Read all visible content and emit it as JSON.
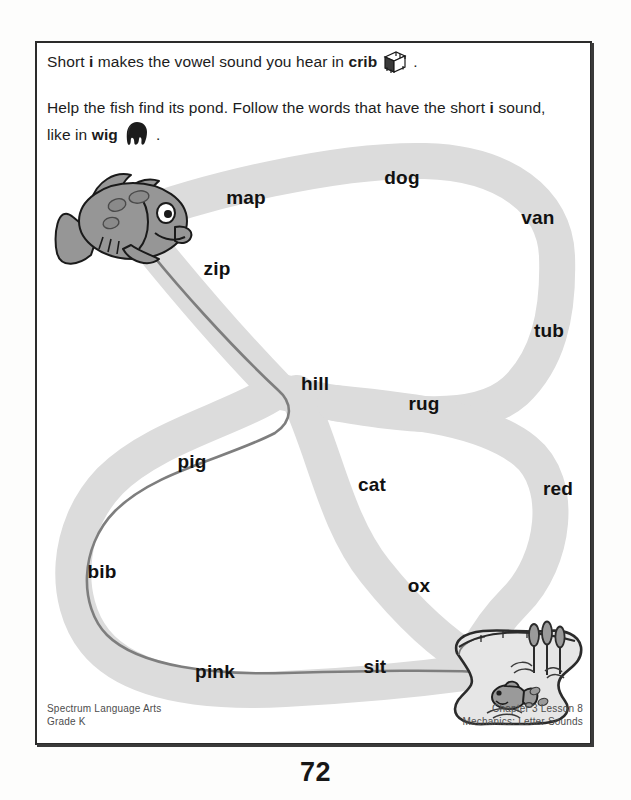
{
  "page": {
    "page_number": "72",
    "background_color": "#ffffff",
    "path_fill_color": "#dcdcdc",
    "answer_line_color": "#7e7e7e",
    "ink_color": "#1a1a1a"
  },
  "instructions": {
    "line1_prefix": "Short ",
    "line1_bold_i": "i",
    "line1_middle": " makes the vowel sound you hear in ",
    "line1_bold_word": "crib",
    "line1_suffix": ".",
    "line1_icon": "crib-icon",
    "line2_part1": "Help the fish find its pond. Follow the words that have the short ",
    "line2_bold_i": "i",
    "line2_part2": " sound,",
    "line3_part1": "like in ",
    "line3_bold_word": "wig",
    "line3_suffix": ".",
    "line3_icon": "wig-icon"
  },
  "maze": {
    "start_icon": "fish-icon",
    "end_icon": "pond-icon",
    "words": [
      {
        "text": "map",
        "x": 211,
        "y": 157,
        "short_i": false
      },
      {
        "text": "dog",
        "x": 367,
        "y": 137,
        "short_i": false
      },
      {
        "text": "van",
        "x": 503,
        "y": 177,
        "short_i": false
      },
      {
        "text": "tub",
        "x": 514,
        "y": 290,
        "short_i": false
      },
      {
        "text": "zip",
        "x": 182,
        "y": 228,
        "short_i": true
      },
      {
        "text": "hill",
        "x": 280,
        "y": 343,
        "short_i": true
      },
      {
        "text": "rug",
        "x": 389,
        "y": 363,
        "short_i": false
      },
      {
        "text": "cat",
        "x": 337,
        "y": 444,
        "short_i": false
      },
      {
        "text": "red",
        "x": 523,
        "y": 448,
        "short_i": false
      },
      {
        "text": "pig",
        "x": 157,
        "y": 421,
        "short_i": true
      },
      {
        "text": "bib",
        "x": 67,
        "y": 531,
        "short_i": true
      },
      {
        "text": "ox",
        "x": 384,
        "y": 545,
        "short_i": false
      },
      {
        "text": "pink",
        "x": 180,
        "y": 631,
        "short_i": true
      },
      {
        "text": "sit",
        "x": 340,
        "y": 626,
        "short_i": true
      }
    ],
    "answer_route": [
      "zip",
      "hill",
      "pig",
      "bib",
      "pink",
      "sit"
    ]
  },
  "footer": {
    "left_line1": "Spectrum Language Arts",
    "left_line2": "Grade K",
    "right_line1": "Chapter 3 Lesson 8",
    "right_line2": "Mechanics: Letter Sounds"
  }
}
